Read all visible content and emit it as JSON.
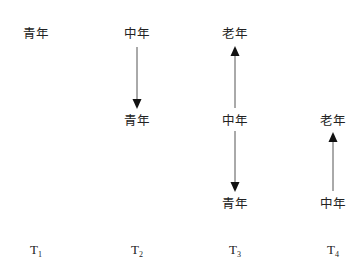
{
  "diagram": {
    "columns": [
      {
        "time": "T",
        "sub": "1",
        "x": 36,
        "nodes": [
          {
            "label": "青年",
            "y": 34
          }
        ],
        "arrows": []
      },
      {
        "time": "T",
        "sub": "2",
        "x": 137,
        "nodes": [
          {
            "label": "中年",
            "y": 34
          },
          {
            "label": "青年",
            "y": 121
          }
        ],
        "arrows": [
          {
            "from": "中年",
            "to": "青年",
            "direction": "down"
          }
        ]
      },
      {
        "time": "T",
        "sub": "3",
        "x": 235,
        "nodes": [
          {
            "label": "老年",
            "y": 34
          },
          {
            "label": "中年",
            "y": 121
          },
          {
            "label": "青年",
            "y": 204
          }
        ],
        "arrows": [
          {
            "from": "中年",
            "to": "老年",
            "direction": "up"
          },
          {
            "from": "中年",
            "to": "青年",
            "direction": "down"
          }
        ]
      },
      {
        "time": "T",
        "sub": "4",
        "x": 333,
        "nodes": [
          {
            "label": "老年",
            "y": 121
          },
          {
            "label": "中年",
            "y": 204
          }
        ],
        "arrows": [
          {
            "from": "中年",
            "to": "老年",
            "direction": "up"
          }
        ]
      }
    ],
    "arrow_color": "#111111",
    "line_color": "#555555"
  }
}
